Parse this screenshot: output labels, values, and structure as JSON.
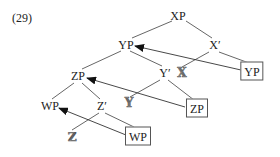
{
  "example_number": "(29)",
  "nodes": {
    "xp": "XP",
    "yp": "YP",
    "x_bar": "X′",
    "yp_moved": "YP",
    "zp": "ZP",
    "y_bar": "Y′",
    "x_head": "𝕏",
    "zp_moved": "ZP",
    "wp": "WP",
    "z_bar": "Z′",
    "y_head": "𝕐",
    "z_head": "ℤ",
    "wp_moved": "WP"
  },
  "colors": {
    "line": "#555555",
    "arrow": "#111111",
    "text": "#222222"
  },
  "movements": [
    {
      "from": "yp_moved",
      "to": "yp"
    },
    {
      "from": "zp_moved",
      "to": "zp"
    },
    {
      "from": "wp_moved",
      "to": "wp"
    }
  ]
}
